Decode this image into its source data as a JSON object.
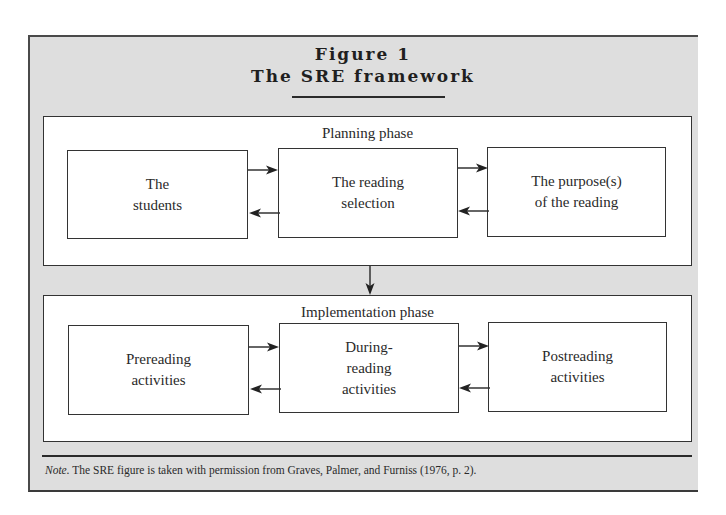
{
  "figure": {
    "label": "Figure 1",
    "title": "The SRE framework"
  },
  "planning_phase": {
    "label": "Planning phase",
    "boxes": [
      {
        "lines": [
          "The",
          "students"
        ]
      },
      {
        "lines": [
          "The reading",
          "selection"
        ]
      },
      {
        "lines": [
          "The purpose(s)",
          "of the reading"
        ]
      }
    ]
  },
  "implementation_phase": {
    "label": "Implementation phase",
    "boxes": [
      {
        "lines": [
          "Prereading",
          "activities"
        ]
      },
      {
        "lines": [
          "During-",
          "reading",
          "activities"
        ]
      },
      {
        "lines": [
          "Postreading",
          "activities"
        ]
      }
    ]
  },
  "note": {
    "prefix": "Note.",
    "text": " The SRE figure is taken with permission from Graves, Palmer, and Furniss (1976, p. 2)."
  },
  "colors": {
    "frame_background": "#dedede",
    "box_background": "#ffffff",
    "stroke": "#333333"
  }
}
